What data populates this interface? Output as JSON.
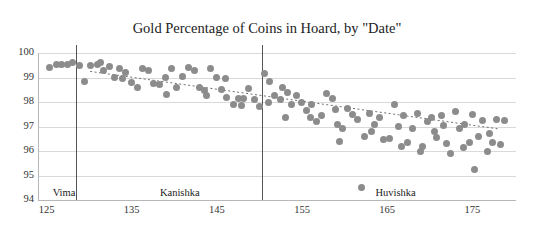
{
  "chart_data": {
    "type": "scatter",
    "title": "Gold Percentage of Coins in Hoard, by \"Date\"",
    "xlabel": "",
    "ylabel": "",
    "xlim": [
      124,
      180
    ],
    "ylim": [
      94,
      100
    ],
    "xticks": [
      125,
      135,
      145,
      155,
      165,
      175
    ],
    "yticks": [
      94,
      95,
      96,
      97,
      98,
      99,
      100
    ],
    "grid": true,
    "legend": "none",
    "marker_color": "#8c8c8c",
    "trendline": {
      "style": "dotted",
      "color": "#6f6f6f",
      "x": [
        130,
        178
      ],
      "y": [
        99.25,
        96.9
      ]
    },
    "annotations": [
      {
        "label": "Vima",
        "x": 125.6,
        "y": 94.25,
        "divider_x": 128.3
      },
      {
        "label": "Kanishka",
        "x": 138.2,
        "y": 94.25,
        "divider_x": 150.2
      },
      {
        "label": "Huvishka",
        "x": 163.5,
        "y": 94.25
      }
    ],
    "dividers": [
      128.3,
      150.2
    ],
    "points": [
      [
        125.2,
        99.4
      ],
      [
        126.0,
        99.55
      ],
      [
        126.6,
        99.55
      ],
      [
        127.3,
        99.55
      ],
      [
        127.9,
        99.6
      ],
      [
        128.8,
        99.5
      ],
      [
        129.4,
        98.85
      ],
      [
        130.1,
        99.5
      ],
      [
        130.9,
        99.55
      ],
      [
        131.6,
        99.3
      ],
      [
        132.3,
        99.45
      ],
      [
        132.9,
        99.0
      ],
      [
        133.5,
        99.35
      ],
      [
        134.2,
        99.2
      ],
      [
        134.9,
        98.8
      ],
      [
        135.6,
        98.6
      ],
      [
        136.2,
        99.35
      ],
      [
        136.9,
        99.3
      ],
      [
        137.5,
        98.75
      ],
      [
        138.2,
        98.7
      ],
      [
        138.9,
        99.0
      ],
      [
        139.6,
        99.35
      ],
      [
        140.2,
        98.6
      ],
      [
        140.9,
        99.05
      ],
      [
        141.5,
        99.4
      ],
      [
        142.2,
        99.3
      ],
      [
        142.8,
        98.6
      ],
      [
        143.4,
        98.45
      ],
      [
        144.1,
        99.35
      ],
      [
        144.8,
        99.0
      ],
      [
        145.4,
        98.5
      ],
      [
        146.0,
        98.2
      ],
      [
        146.8,
        97.9
      ],
      [
        147.4,
        98.15
      ],
      [
        148.0,
        98.15
      ],
      [
        148.6,
        98.55
      ],
      [
        149.3,
        98.1
      ],
      [
        149.9,
        97.8
      ],
      [
        150.5,
        99.15
      ],
      [
        151.1,
        98.85
      ],
      [
        151.7,
        98.25
      ],
      [
        152.3,
        98.1
      ],
      [
        152.9,
        97.35
      ],
      [
        153.6,
        97.9
      ],
      [
        154.2,
        98.25
      ],
      [
        154.8,
        98.0
      ],
      [
        155.4,
        97.65
      ],
      [
        156.0,
        97.9
      ],
      [
        156.6,
        97.2
      ],
      [
        157.2,
        97.45
      ],
      [
        157.8,
        98.35
      ],
      [
        158.4,
        98.15
      ],
      [
        159.0,
        97.1
      ],
      [
        159.6,
        96.9
      ],
      [
        160.2,
        97.75
      ],
      [
        160.8,
        97.5
      ],
      [
        161.4,
        97.3
      ],
      [
        161.9,
        94.5
      ],
      [
        162.2,
        96.6
      ],
      [
        162.8,
        97.55
      ],
      [
        163.4,
        97.1
      ],
      [
        164.0,
        97.35
      ],
      [
        164.5,
        96.45
      ],
      [
        165.1,
        96.5
      ],
      [
        165.7,
        97.9
      ],
      [
        166.2,
        97.0
      ],
      [
        166.8,
        97.45
      ],
      [
        167.3,
        96.35
      ],
      [
        167.9,
        96.9
      ],
      [
        168.4,
        97.55
      ],
      [
        169.0,
        96.2
      ],
      [
        169.6,
        97.2
      ],
      [
        170.1,
        97.35
      ],
      [
        170.7,
        96.55
      ],
      [
        171.2,
        97.45
      ],
      [
        171.8,
        96.3
      ],
      [
        172.3,
        95.9
      ],
      [
        172.9,
        97.6
      ],
      [
        173.4,
        96.9
      ],
      [
        174.0,
        97.1
      ],
      [
        174.5,
        96.35
      ],
      [
        175.1,
        95.25
      ],
      [
        175.6,
        96.6
      ],
      [
        176.1,
        97.25
      ],
      [
        176.7,
        96.0
      ],
      [
        177.2,
        96.35
      ],
      [
        177.7,
        97.3
      ],
      [
        178.2,
        96.25
      ],
      [
        178.6,
        97.25
      ],
      [
        131.2,
        99.6
      ],
      [
        133.8,
        98.95
      ],
      [
        139.0,
        98.3
      ],
      [
        143.7,
        98.25
      ],
      [
        147.8,
        97.85
      ],
      [
        150.9,
        98.0
      ],
      [
        153.2,
        98.4
      ],
      [
        155.9,
        97.35
      ],
      [
        158.8,
        97.7
      ],
      [
        163.0,
        96.8
      ],
      [
        166.6,
        96.2
      ],
      [
        170.4,
        96.8
      ],
      [
        173.8,
        96.15
      ],
      [
        176.9,
        96.7
      ],
      [
        145.9,
        98.95
      ],
      [
        152.6,
        98.6
      ],
      [
        159.3,
        96.4
      ],
      [
        168.8,
        96.0
      ],
      [
        171.5,
        97.05
      ],
      [
        174.9,
        97.5
      ]
    ]
  }
}
